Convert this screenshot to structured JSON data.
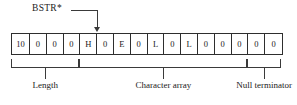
{
  "diagram": {
    "pointer": {
      "label": "BSTR*",
      "icon": "down-arrow-icon",
      "points_to_cell_index": 4
    },
    "cells": [
      {
        "value": "10"
      },
      {
        "value": "0"
      },
      {
        "value": "0"
      },
      {
        "value": "0"
      },
      {
        "value": "H"
      },
      {
        "value": "0"
      },
      {
        "value": "E"
      },
      {
        "value": "0"
      },
      {
        "value": "L"
      },
      {
        "value": "0"
      },
      {
        "value": "L"
      },
      {
        "value": "0"
      },
      {
        "value": "0"
      },
      {
        "value": "0"
      },
      {
        "value": "0"
      },
      {
        "value": "0"
      }
    ],
    "groups": [
      {
        "label": "Length",
        "start_cell": 0,
        "end_cell": 3
      },
      {
        "label": "Character array",
        "start_cell": 4,
        "end_cell": 13
      },
      {
        "label": "Null terminator",
        "start_cell": 14,
        "end_cell": 15
      }
    ],
    "colors": {
      "line": "#2e2e2e",
      "text": "#1a1a1a",
      "background": "#ffffff"
    }
  }
}
